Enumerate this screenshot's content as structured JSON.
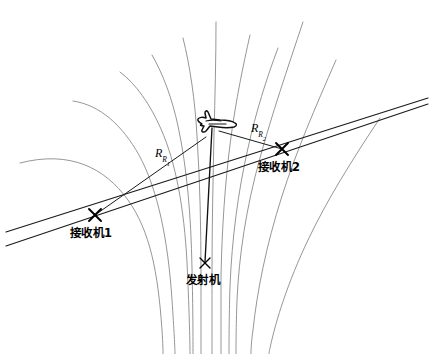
{
  "figure": {
    "background_color": "#ffffff",
    "contour_color": "#8a8a8a",
    "line_color": "#1a1a1a",
    "width": 435,
    "height": 354
  },
  "labels": {
    "receiver1": "接收机1",
    "receiver2": "接收机2",
    "transmitter": "发射机",
    "range1_base": "R",
    "range1_sub": "R",
    "range1_index": "1",
    "range2_base": "R",
    "range2_sub": "R",
    "range2_index": "2"
  },
  "nodes": [
    {
      "name": "receiver-1",
      "label": "接收机1",
      "x": 95,
      "y": 215,
      "marker": "x"
    },
    {
      "name": "receiver-2",
      "label": "接收机2",
      "x": 282,
      "y": 149,
      "marker": "x"
    },
    {
      "name": "transmitter",
      "label": "发射机",
      "x": 205,
      "y": 265,
      "marker": "x"
    },
    {
      "name": "target-aircraft",
      "label": "",
      "x": 213,
      "y": 122,
      "marker": "aircraft"
    }
  ],
  "range_links": [
    {
      "name": "range-to-receiver-1",
      "label": "R_R1",
      "from": "target-aircraft",
      "to": "receiver-1"
    },
    {
      "name": "range-to-receiver-2",
      "label": "R_R2",
      "from": "target-aircraft",
      "to": "receiver-2"
    },
    {
      "name": "transmitter-to-target",
      "label": "",
      "from": "transmitter",
      "to": "target-aircraft"
    }
  ],
  "baselines": [
    {
      "name": "baseline-upper",
      "from_x": 8,
      "from_y": 233,
      "to_x": 424,
      "to_y": 100
    },
    {
      "name": "baseline-lower",
      "from_x": 8,
      "from_y": 243,
      "to_x": 424,
      "to_y": 104
    }
  ],
  "contours": {
    "count": 11,
    "description": "Family of Cassini-oval iso-range contours around transmitter and receivers"
  }
}
